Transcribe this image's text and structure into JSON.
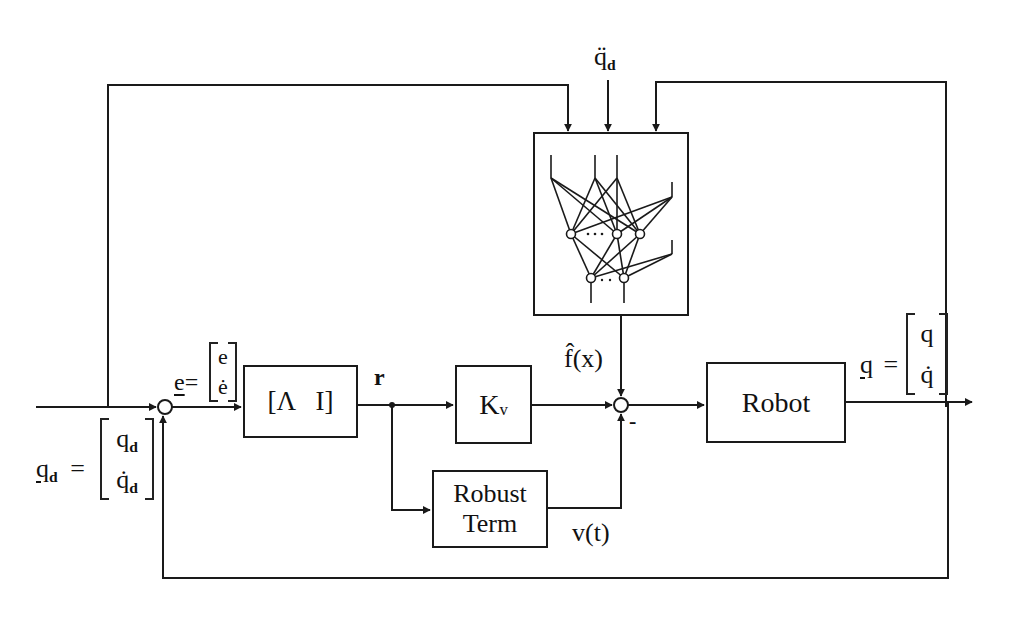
{
  "diagram": {
    "type": "block-diagram",
    "blocks": {
      "lambda_block": {
        "label": "[Λ   I]"
      },
      "kv_block": {
        "label": "K",
        "subscript": "v"
      },
      "robot_block": {
        "label": "Robot"
      },
      "robust_block": {
        "line1": "Robust",
        "line2": "Term"
      },
      "neural_net_block": {
        "label": "neural network"
      }
    },
    "signals": {
      "desired_input": {
        "symbol": "q",
        "subscript": "d",
        "equals": "=",
        "row1": "q",
        "row1_sub": "d",
        "row2": "q̇",
        "row2_sub": "d"
      },
      "error": {
        "symbol": "e",
        "equals": "=",
        "row1": "e",
        "row2": "ė"
      },
      "filtered_error": {
        "symbol": "r"
      },
      "nn_output": {
        "symbol": "f̂(x)"
      },
      "robust_output": {
        "symbol": "v(t)"
      },
      "minus_sign": {
        "symbol": "-"
      },
      "accel_input": {
        "symbol": "q̈",
        "subscript": "d"
      },
      "output": {
        "symbol": "q",
        "equals": "=",
        "row1": "q",
        "row2": "q̇"
      }
    },
    "colors": {
      "line": "#1a1a1a",
      "background": "#ffffff"
    }
  }
}
